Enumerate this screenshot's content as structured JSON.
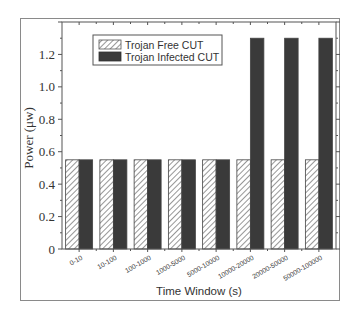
{
  "chart_data": {
    "type": "bar",
    "title": "",
    "xlabel": "Time Window (s)",
    "ylabel": "Power (μw)",
    "ylim": [
      0,
      1.4
    ],
    "yticks": [
      0,
      0.2,
      0.4,
      0.6,
      0.8,
      1.0,
      1.2
    ],
    "ytick_labels": [
      "0",
      "0.2",
      "0.4",
      "0.6",
      "0.8",
      "1.0",
      "1.2"
    ],
    "grid": false,
    "legend_position": "upper left (inside)",
    "categories": [
      "0-10",
      "10-100",
      "100-1000",
      "1000-5000",
      "5000-10000",
      "10000-20000",
      "20000-50000",
      "50000-100000"
    ],
    "series": [
      {
        "name": "Trojan Free CUT",
        "style": "hatched",
        "color": "#ffffff",
        "values": [
          0.55,
          0.55,
          0.55,
          0.55,
          0.55,
          0.55,
          0.55,
          0.55
        ]
      },
      {
        "name": "Trojan Infected CUT",
        "style": "solid",
        "color": "#3a3a3a",
        "values": [
          0.55,
          0.55,
          0.55,
          0.55,
          0.55,
          1.3,
          1.3,
          1.3
        ]
      }
    ]
  }
}
